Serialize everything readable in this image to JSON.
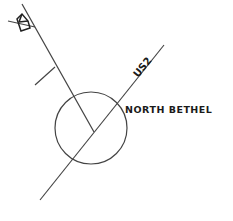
{
  "map": {
    "town_label": "NORTH BETHEL",
    "route_label": "US2",
    "line_color": "#333333",
    "text_color": "#1a1a1a",
    "icons": [
      "house-icon",
      "town-circle"
    ]
  }
}
